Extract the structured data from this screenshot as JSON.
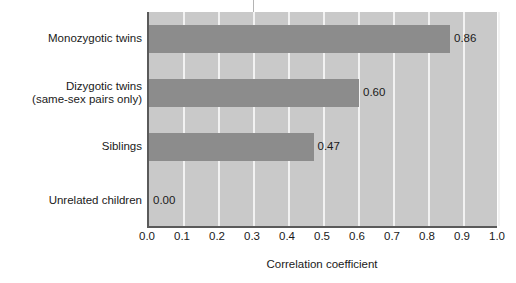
{
  "chart_data": {
    "type": "bar",
    "orientation": "horizontal",
    "title": "",
    "xlabel": "Correlation coefficient",
    "ylabel": "",
    "xlim": [
      0.0,
      1.0
    ],
    "grid": true,
    "legend": "none",
    "categories": [
      "Monozygotic twins",
      "Dizygotic twins\n(same-sex pairs only)",
      "Siblings",
      "Unrelated children"
    ],
    "values": [
      0.86,
      0.6,
      0.47,
      0.0
    ],
    "value_labels": [
      "0.86",
      "0.60",
      "0.47",
      "0.00"
    ],
    "xticks": [
      0.0,
      0.1,
      0.2,
      0.3,
      0.4,
      0.5,
      0.6,
      0.7,
      0.8,
      0.9,
      1.0
    ],
    "xtick_labels": [
      "0.0",
      "0.1",
      "0.2",
      "0.3",
      "0.4",
      "0.5",
      "0.6",
      "0.7",
      "0.8",
      "0.9",
      "1.0"
    ],
    "colors": {
      "bar": "#8c8c8c",
      "plot_background": "#c9c9c9",
      "gridline": "#f2f2f2",
      "axis": "#5a5a5a",
      "text": "#1a1a1a",
      "page_background": "#ffffff"
    }
  }
}
